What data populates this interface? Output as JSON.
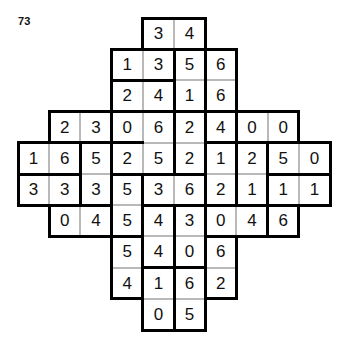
{
  "puzzle": {
    "number": "73",
    "type": "domino-grid",
    "grid_columns": 10,
    "grid_rows": 10,
    "cell_size": 31.2,
    "colors": {
      "cell_border": "#b9b9b9",
      "domino_border": "#000000",
      "digit": "#111111",
      "background": "#ffffff"
    },
    "rows": [
      {
        "index": 0,
        "start_col": 4,
        "values": [
          "3",
          "4"
        ]
      },
      {
        "index": 1,
        "start_col": 3,
        "values": [
          "1",
          "3",
          "5",
          "6"
        ]
      },
      {
        "index": 2,
        "start_col": 3,
        "values": [
          "2",
          "4",
          "1",
          "6"
        ]
      },
      {
        "index": 3,
        "start_col": 1,
        "values": [
          "2",
          "3",
          "0",
          "6",
          "2",
          "4",
          "0",
          "0"
        ]
      },
      {
        "index": 4,
        "start_col": 0,
        "values": [
          "1",
          "6",
          "5",
          "2",
          "5",
          "2",
          "1",
          "2",
          "5",
          "0"
        ]
      },
      {
        "index": 5,
        "start_col": 0,
        "values": [
          "3",
          "3",
          "3",
          "5",
          "3",
          "6",
          "2",
          "1",
          "1",
          "1"
        ]
      },
      {
        "index": 6,
        "start_col": 1,
        "values": [
          "0",
          "4",
          "5",
          "4",
          "3",
          "0",
          "4",
          "6"
        ]
      },
      {
        "index": 7,
        "start_col": 3,
        "values": [
          "5",
          "4",
          "0",
          "6"
        ]
      },
      {
        "index": 8,
        "start_col": 3,
        "values": [
          "4",
          "1",
          "6",
          "2"
        ]
      },
      {
        "index": 9,
        "start_col": 4,
        "values": [
          "0",
          "5"
        ]
      }
    ]
  }
}
